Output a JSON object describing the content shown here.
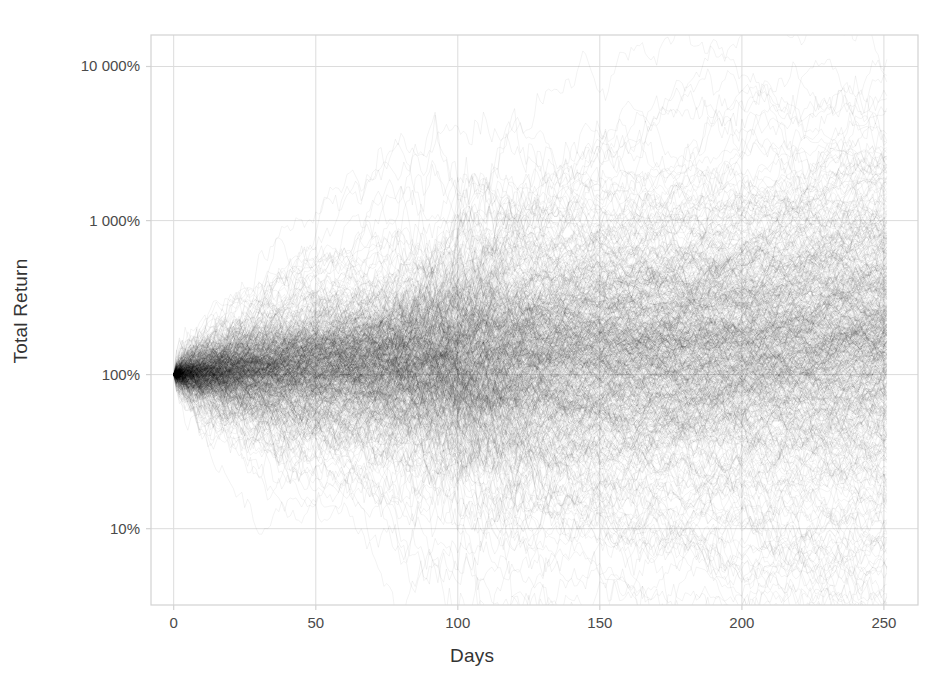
{
  "chart_data": {
    "type": "line",
    "title": "",
    "subtitle": "",
    "xlabel": "Days",
    "ylabel": "Total Return",
    "yscale": "log",
    "xlim": [
      -8,
      262
    ],
    "ylim": [
      3.2,
      16000
    ],
    "grid": true,
    "legend": null,
    "legend_position": "none",
    "xticks": [
      {
        "value": 0,
        "label": "0"
      },
      {
        "value": 50,
        "label": "50"
      },
      {
        "value": 100,
        "label": "100"
      },
      {
        "value": 150,
        "label": "150"
      },
      {
        "value": 200,
        "label": "200"
      },
      {
        "value": 250,
        "label": "250"
      }
    ],
    "yticks": [
      {
        "value": 10000,
        "label": "10 000%"
      },
      {
        "value": 1000,
        "label": "1 000%"
      },
      {
        "value": 100,
        "label": "100%"
      },
      {
        "value": 10,
        "label": "10%"
      }
    ],
    "series_count": 600,
    "n_days": 251,
    "start_value": 100,
    "series_style": {
      "color": "#000000",
      "opacity": 0.09,
      "width": 0.6
    },
    "x": [
      0,
      10,
      20,
      30,
      40,
      50,
      60,
      70,
      80,
      90,
      100,
      110,
      120,
      130,
      140,
      150,
      160,
      170,
      180,
      190,
      200,
      210,
      220,
      230,
      240,
      251
    ],
    "quantiles": {
      "max": [
        100,
        190,
        420,
        900,
        1500,
        1750,
        1800,
        2050,
        2500,
        3400,
        3900,
        3400,
        2600,
        2500,
        2450,
        2400,
        2350,
        2500,
        2650,
        2800,
        2900,
        2950,
        3050,
        3200,
        3350,
        3500
      ],
      "p95": [
        100,
        150,
        260,
        420,
        640,
        800,
        880,
        950,
        1050,
        1200,
        1300,
        1250,
        1200,
        1250,
        1300,
        1350,
        1400,
        1500,
        1600,
        1700,
        1800,
        1900,
        2000,
        2100,
        2200,
        2350
      ],
      "p75": [
        100,
        125,
        165,
        215,
        270,
        320,
        355,
        385,
        410,
        440,
        465,
        480,
        500,
        525,
        550,
        580,
        610,
        640,
        670,
        700,
        730,
        760,
        790,
        820,
        850,
        880
      ],
      "median": [
        100,
        103,
        107,
        112,
        117,
        122,
        126,
        130,
        134,
        138,
        142,
        146,
        150,
        154,
        158,
        162,
        166,
        170,
        174,
        178,
        182,
        186,
        190,
        194,
        198,
        203
      ],
      "p25": [
        100,
        84,
        73,
        66,
        61,
        57,
        55,
        53,
        51,
        50,
        49,
        48,
        48,
        47,
        47,
        47,
        47,
        47,
        47,
        47,
        47,
        47,
        47,
        47,
        47,
        47
      ],
      "p05": [
        100,
        66,
        50,
        40,
        33,
        29,
        26,
        24,
        22,
        21,
        20,
        19,
        19,
        19,
        19,
        19,
        19,
        19,
        19,
        19,
        19,
        19,
        19,
        19,
        19,
        19
      ],
      "min": [
        100,
        52,
        33,
        24,
        18,
        15,
        12,
        10,
        8.5,
        6.5,
        5.2,
        4.8,
        6.0,
        7.0,
        7.5,
        7.6,
        7.7,
        7.8,
        7.9,
        8.0,
        8.1,
        8.2,
        8.3,
        8.4,
        8.5,
        8.6
      ]
    }
  },
  "style": {
    "background": "#ffffff",
    "grid_color": "#dcdcdc",
    "frame_color": "#d2d2d2",
    "tick_text_color": "#4a4a4a",
    "axis_title_color": "#333333",
    "path_color": "#000000"
  },
  "axes": {
    "ylabel_text": "Total Return",
    "xlabel_text": "Days"
  }
}
